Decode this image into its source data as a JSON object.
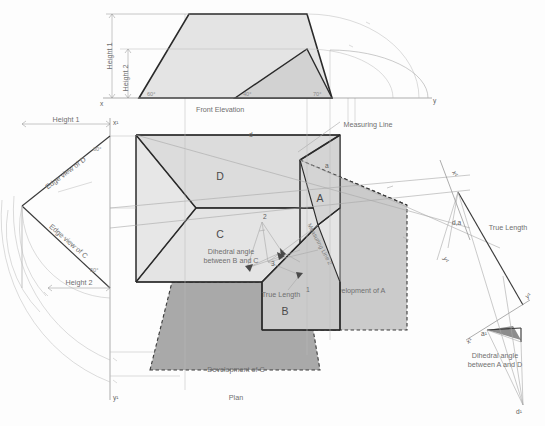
{
  "drawing": {
    "title": "Orthographic projection with auxiliary views, dihedral angles and surface developments",
    "background_color": "#fdfdfd",
    "line_color_heavy": "#2a2a2a",
    "line_color_thin": "#b9b9b9",
    "fill_light": "#e2e2e2",
    "fill_mid": "#cfcfcf",
    "fill_dark": "#a9a9a9"
  },
  "views": {
    "front_elevation": {
      "label": "Front Elevation",
      "angles": [
        {
          "value": "60°"
        },
        {
          "value": "40°"
        },
        {
          "value": "70°"
        }
      ],
      "dimensions": [
        {
          "label": "Height 1"
        },
        {
          "label": "Height 2"
        }
      ],
      "ground_line_left": "x",
      "ground_line_right": "y"
    },
    "plan": {
      "label": "Plan",
      "faces": [
        {
          "label": "D"
        },
        {
          "label": "C"
        },
        {
          "label": "A"
        },
        {
          "label": "B"
        }
      ],
      "points": [
        {
          "label": "d"
        },
        {
          "label": "a"
        },
        {
          "label": "1"
        },
        {
          "label": "2"
        },
        {
          "label": "3"
        }
      ],
      "annotations": [
        {
          "label": "Measuring Line"
        },
        {
          "label": "Dihedral angle between B and C"
        },
        {
          "label": "True Length"
        },
        {
          "label": "Measuring Line 2"
        }
      ]
    },
    "auxiliary_left": {
      "edge_view_d": "Edge view of D",
      "edge_view_c": "Edge view of C",
      "angle_d": "60°",
      "angle_c": "50°",
      "dim_height1": "Height 1",
      "dim_height2": "Height 2",
      "axis_x1": "x¹",
      "axis_y1": "y¹"
    },
    "auxiliary_right": {
      "true_length": "True Length",
      "point_da": "d,a",
      "point_a1": "a¹",
      "point_d1": "d¹",
      "axis_x1_upper": "x¹",
      "axis_y1_upper": "y¹",
      "axis_x1_lower": "x¹",
      "axis_y1_lower": "y¹",
      "dihedral": "Dihedral angle between A and D"
    },
    "developments": [
      {
        "label": "Development of A"
      },
      {
        "label": "Development of C"
      }
    ]
  }
}
